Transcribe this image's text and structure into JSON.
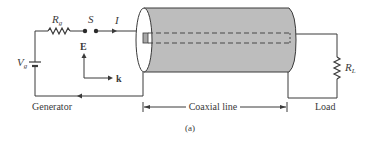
{
  "figure": {
    "caption": "(a)",
    "components": {
      "source_resistor": {
        "label": "R",
        "subscript": "g"
      },
      "source_voltage": {
        "label": "V",
        "subscript": "g"
      },
      "switch": {
        "label": "S"
      },
      "current": {
        "label": "I"
      },
      "electric_field": {
        "label": "E"
      },
      "wave_vector": {
        "label": "k"
      },
      "load_resistor": {
        "label": "R",
        "subscript": "L"
      }
    },
    "sections": {
      "generator": "Generator",
      "line": "Coaxial line",
      "load": "Load"
    },
    "colors": {
      "line": "#3a3a3a",
      "cylinder_fill": "#bdbdbd",
      "cylinder_face": "#ffffff"
    }
  }
}
